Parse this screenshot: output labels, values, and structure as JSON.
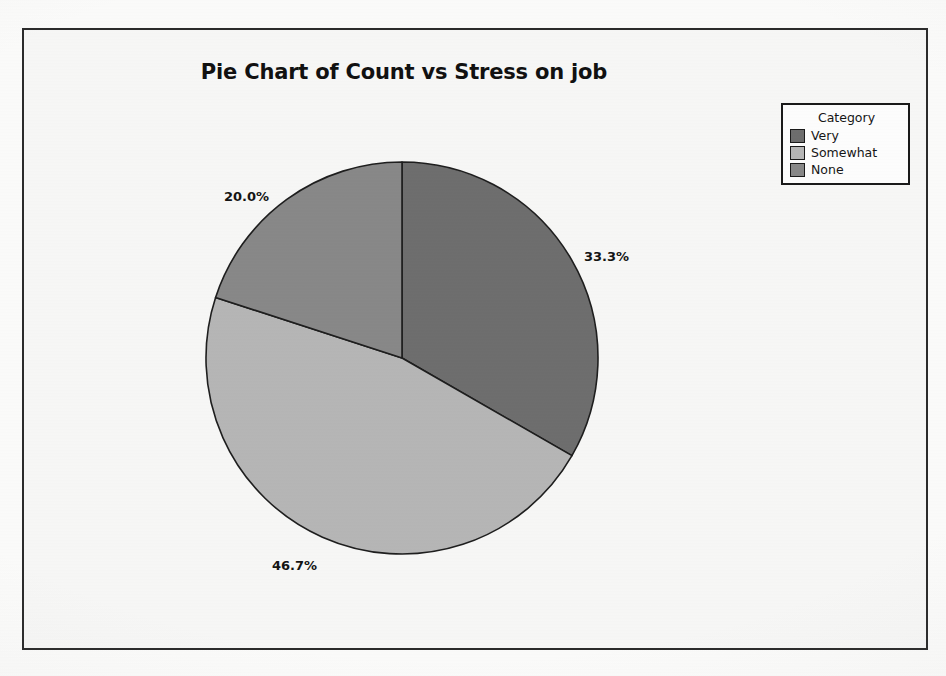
{
  "chart_data": {
    "type": "pie",
    "title": "Pie Chart of Count vs Stress on job",
    "legend_title": "Category",
    "legend_position": "top-right",
    "categories": [
      "Very",
      "Somewhat",
      "None"
    ],
    "values": [
      33.3,
      46.7,
      20.0
    ],
    "value_unit": "percent",
    "data_labels": [
      "33.3%",
      "46.7%",
      "20.0%"
    ],
    "colors": [
      "#6e6e6e",
      "#b6b6b6",
      "#888888"
    ],
    "start_angle_deg": 0,
    "direction": "clockwise",
    "xlabel": "",
    "ylabel": ""
  },
  "figure": {
    "title": "Pie Chart of Count vs Stress on job",
    "background": "#f7f7f6",
    "border_color": "#2b2b2b"
  },
  "legend": {
    "title": "Category",
    "items": [
      {
        "label": "Very",
        "color": "#6e6e6e"
      },
      {
        "label": "Somewhat",
        "color": "#b6b6b6"
      },
      {
        "label": "None",
        "color": "#888888"
      }
    ]
  },
  "labels": {
    "slice_0": "33.3%",
    "slice_1": "46.7%",
    "slice_2": "20.0%"
  }
}
